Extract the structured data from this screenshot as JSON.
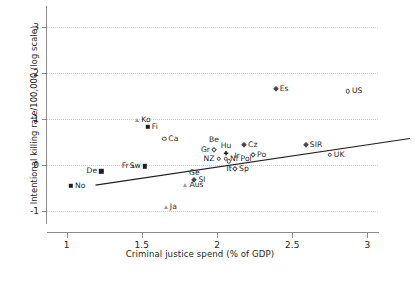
{
  "chart_data": {
    "type": "scatter",
    "title": "",
    "xlabel": "Criminal justice spend (% of GDP)",
    "ylabel": "Intentional killing rate/100,000 (log scale)",
    "xlim": [
      0.87,
      3.07
    ],
    "ylim": [
      -1.25,
      3.45
    ],
    "xticks": [
      1,
      1.5,
      2,
      2.5,
      3
    ],
    "xticklabels": [
      "1",
      "1.5",
      "2",
      "2.5",
      "3"
    ],
    "yticks": [
      -1,
      0,
      1,
      2,
      3
    ],
    "yticklabels": [
      "-1",
      "0",
      "1",
      "2",
      "3"
    ],
    "grid": "horizontal-dotted",
    "legend": "none",
    "trendline": {
      "label": "linear fit",
      "x": [
        0.88,
        2.97
      ],
      "y": [
        -0.3,
        0.71
      ]
    },
    "points": [
      {
        "label": "No",
        "x": 1.03,
        "y": -0.45,
        "marker": "square-filled",
        "label_pos": "right"
      },
      {
        "label": "De",
        "x": 1.23,
        "y": -0.13,
        "marker": "square-filled",
        "label_pos": "left"
      },
      {
        "label": "Fr",
        "x": 1.44,
        "y": -0.02,
        "marker": "triangle",
        "label_pos": "left"
      },
      {
        "label": "Sw",
        "x": 1.52,
        "y": -0.02,
        "marker": "square-filled",
        "label_pos": "left"
      },
      {
        "label": "Ko",
        "x": 1.47,
        "y": 0.98,
        "marker": "triangle",
        "label_pos": "right"
      },
      {
        "label": "Fi",
        "x": 1.54,
        "y": 0.83,
        "marker": "square-filled",
        "label_pos": "right"
      },
      {
        "label": "Ca",
        "x": 1.65,
        "y": 0.58,
        "marker": "circle",
        "label_pos": "right"
      },
      {
        "label": "Ge",
        "x": 1.85,
        "y": -0.32,
        "marker": "diamond-filled",
        "label_pos": "above"
      },
      {
        "label": "Sl",
        "x": 1.85,
        "y": -0.32,
        "marker": "none",
        "label_pos": "right"
      },
      {
        "label": "Aus",
        "x": 1.79,
        "y": -0.43,
        "marker": "triangle",
        "label_pos": "right"
      },
      {
        "label": "Ja",
        "x": 1.66,
        "y": -0.9,
        "marker": "triangle",
        "label_pos": "right"
      },
      {
        "label": "Be",
        "x": 1.98,
        "y": 0.4,
        "marker": "none",
        "label_pos": "above"
      },
      {
        "label": "Gr",
        "x": 1.98,
        "y": 0.33,
        "marker": "diamond",
        "label_pos": "left"
      },
      {
        "label": "Hu",
        "x": 2.06,
        "y": 0.26,
        "marker": "plus-filled",
        "label_pos": "above"
      },
      {
        "label": "NZ",
        "x": 2.01,
        "y": 0.14,
        "marker": "circle",
        "label_pos": "left"
      },
      {
        "label": "Nl",
        "x": 2.06,
        "y": 0.14,
        "marker": "circle",
        "label_pos": "right"
      },
      {
        "label": "Ir",
        "x": 2.09,
        "y": 0.2,
        "marker": "none",
        "label_pos": "right"
      },
      {
        "label": "It",
        "x": 2.08,
        "y": 0.09,
        "marker": "circle",
        "label_pos": "below"
      },
      {
        "label": "Pol",
        "x": 2.13,
        "y": 0.13,
        "marker": "none",
        "label_pos": "right"
      },
      {
        "label": "Sp",
        "x": 2.12,
        "y": -0.07,
        "marker": "diamond",
        "label_pos": "right"
      },
      {
        "label": "Cz",
        "x": 2.18,
        "y": 0.44,
        "marker": "diamond-filled",
        "label_pos": "right"
      },
      {
        "label": "Po",
        "x": 2.24,
        "y": 0.23,
        "marker": "diamond",
        "label_pos": "right"
      },
      {
        "label": "Es",
        "x": 2.39,
        "y": 1.65,
        "marker": "diamond-filled",
        "label_pos": "right"
      },
      {
        "label": "SIR",
        "x": 2.59,
        "y": 0.44,
        "marker": "diamond-filled",
        "label_pos": "right"
      },
      {
        "label": "UK",
        "x": 2.75,
        "y": 0.23,
        "marker": "circle",
        "label_pos": "right"
      },
      {
        "label": "US",
        "x": 2.87,
        "y": 1.6,
        "marker": "circle",
        "label_pos": "right"
      }
    ]
  }
}
